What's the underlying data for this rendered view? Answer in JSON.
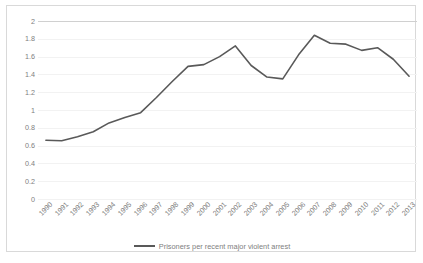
{
  "chart_data": {
    "type": "line",
    "title": "",
    "xlabel": "",
    "ylabel": "",
    "ylim": [
      0,
      2
    ],
    "xlim": [
      "1990",
      "2013"
    ],
    "grid": true,
    "legend_position": "bottom",
    "y_ticks": [
      "0",
      "0.2",
      "0.4",
      "0.6",
      "0.8",
      "1",
      "1.2",
      "1.4",
      "1.6",
      "1.8",
      "2"
    ],
    "y_tick_values": [
      0,
      0.2,
      0.4,
      0.6,
      0.8,
      1,
      1.2,
      1.4,
      1.6,
      1.8,
      2
    ],
    "categories": [
      "1990",
      "1991",
      "1992",
      "1993",
      "1994",
      "1995",
      "1996",
      "1997",
      "1998",
      "1999",
      "2000",
      "2001",
      "2002",
      "2003",
      "2004",
      "2005",
      "2006",
      "2007",
      "2008",
      "2009",
      "2010",
      "2011",
      "2012",
      "2013"
    ],
    "series": [
      {
        "name": "Prisoners per recent major violent arrest",
        "color": "#595959",
        "values": [
          0.66,
          0.655,
          0.7,
          0.755,
          0.855,
          0.915,
          0.97,
          1.14,
          1.32,
          1.49,
          1.51,
          1.6,
          1.72,
          1.5,
          1.37,
          1.35,
          1.62,
          1.84,
          1.75,
          1.74,
          1.67,
          1.7,
          1.57,
          1.38
        ]
      }
    ]
  },
  "legend": {
    "entries": [
      {
        "label": "Prisoners per recent major violent arrest",
        "color": "#595959"
      }
    ]
  },
  "colors": {
    "series": "#595959",
    "gridline": "#f2f2f2",
    "axis_text": "#808080",
    "border": "#d9d9d9"
  }
}
